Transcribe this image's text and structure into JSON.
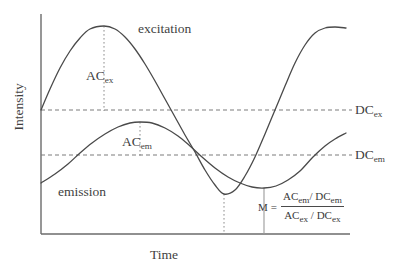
{
  "figure": {
    "axes": {
      "x_label": "Time",
      "y_label": "Intensity"
    },
    "curve_labels": {
      "excitation": "excitation",
      "emission": "emission"
    },
    "amplitude_labels": {
      "ac_ex_prefix": "AC",
      "ac_ex_sub": "ex",
      "ac_em_prefix": "AC",
      "ac_em_sub": "em"
    },
    "level_labels": {
      "dc_ex_prefix": "DC",
      "dc_ex_sub": "ex",
      "dc_em_prefix": "DC",
      "dc_em_sub": "em"
    },
    "formula": {
      "lhs": "M",
      "equals": "=",
      "numerator": "AC em / DC em",
      "denominator": "AC ex / DC ex",
      "num_first": "AC",
      "num_first_sub": "em",
      "num_slash": "/",
      "num_second": "DC",
      "num_second_sub": "em",
      "den_first": "AC",
      "den_first_sub": "ex",
      "den_slash": "/",
      "den_second": "DC",
      "den_second_sub": "ex"
    },
    "colors": {
      "curve": "#4a4a4a",
      "axis": "#6b6b6b",
      "dc_line": "#7d7d7d",
      "marker": "#8c8c8c",
      "text": "#3f3f3f",
      "background": "#ffffff"
    }
  },
  "chart_data": {
    "type": "line",
    "title": "",
    "xlabel": "Time",
    "ylabel": "Intensity",
    "xlim": [
      0,
      1
    ],
    "ylim": [
      0,
      1
    ],
    "grid": false,
    "legend": "inline-annotations",
    "plot_geometry": {
      "x_axis_y": 234,
      "y_axis_x": 41,
      "plot_right": 350,
      "plot_top": 14
    },
    "series": [
      {
        "name": "excitation",
        "dc_level_y": 110,
        "amplitude_y": 84,
        "period_px": 240,
        "start_x": 41,
        "end_x": 346,
        "phase_deg": 0,
        "peak_x": 104,
        "peak_y": 26,
        "trough_x": 224,
        "trough_y": 194,
        "samples": [
          [
            41,
            110
          ],
          [
            50,
            89
          ],
          [
            60,
            68
          ],
          [
            70,
            51
          ],
          [
            80,
            38
          ],
          [
            90,
            29
          ],
          [
            104,
            26
          ],
          [
            115,
            29
          ],
          [
            125,
            37
          ],
          [
            135,
            49
          ],
          [
            145,
            64
          ],
          [
            155,
            81
          ],
          [
            165,
            99
          ],
          [
            175,
            117
          ],
          [
            185,
            135
          ],
          [
            195,
            152
          ],
          [
            205,
            170
          ],
          [
            215,
            185
          ],
          [
            224,
            194
          ],
          [
            235,
            190
          ],
          [
            245,
            176
          ],
          [
            255,
            157
          ],
          [
            265,
            134
          ],
          [
            275,
            110
          ],
          [
            285,
            86
          ],
          [
            295,
            63
          ],
          [
            305,
            45
          ],
          [
            315,
            33
          ],
          [
            325,
            28
          ],
          [
            335,
            27
          ],
          [
            346,
            28
          ]
        ]
      },
      {
        "name": "emission",
        "dc_level_y": 155,
        "amplitude_y": 33,
        "period_px": 248,
        "start_x": 41,
        "end_x": 346,
        "phase_shift_px": 38,
        "peak_x": 140,
        "peak_y": 122,
        "trough_x": 264,
        "trough_y": 188,
        "samples": [
          [
            41,
            183
          ],
          [
            55,
            174
          ],
          [
            68,
            164
          ],
          [
            80,
            153
          ],
          [
            92,
            143
          ],
          [
            105,
            134
          ],
          [
            118,
            127
          ],
          [
            130,
            123
          ],
          [
            140,
            122
          ],
          [
            152,
            123
          ],
          [
            165,
            128
          ],
          [
            178,
            136
          ],
          [
            190,
            146
          ],
          [
            202,
            157
          ],
          [
            215,
            168
          ],
          [
            228,
            177
          ],
          [
            240,
            183
          ],
          [
            252,
            187
          ],
          [
            264,
            188
          ],
          [
            276,
            186
          ],
          [
            288,
            180
          ],
          [
            300,
            171
          ],
          [
            313,
            157
          ],
          [
            325,
            146
          ],
          [
            335,
            139
          ],
          [
            346,
            133
          ]
        ]
      }
    ],
    "reference_lines": [
      {
        "name": "DC_ex",
        "label": "DC",
        "sublabel": "ex",
        "y": 110,
        "x_start": 41,
        "x_end": 350,
        "style": "dashed",
        "orientation": "horizontal"
      },
      {
        "name": "DC_em",
        "label": "DC",
        "sublabel": "em",
        "y": 155,
        "x_start": 41,
        "x_end": 350,
        "style": "dashed",
        "orientation": "horizontal"
      }
    ],
    "annotation_lines": [
      {
        "name": "AC_ex_marker",
        "label": "AC",
        "sublabel": "ex",
        "x": 104,
        "y_start": 26,
        "y_end": 110,
        "style": "dotted",
        "orientation": "vertical",
        "meaning": "excitation AC amplitude from peak to DC level"
      },
      {
        "name": "AC_em_marker",
        "label": "AC",
        "sublabel": "em",
        "x": 140,
        "y_start": 122,
        "y_end": 156,
        "style": "dotted",
        "orientation": "vertical",
        "meaning": "emission AC amplitude from peak to DC level"
      },
      {
        "name": "excitation_trough_marker",
        "x": 224,
        "y_start": 194,
        "y_end": 234,
        "style": "dotted",
        "orientation": "vertical",
        "meaning": "time of excitation minimum"
      },
      {
        "name": "emission_trough_marker",
        "x": 264,
        "y_start": 188,
        "y_end": 234,
        "style": "solid",
        "orientation": "vertical",
        "meaning": "time of emission minimum, showing phase delay"
      }
    ],
    "annotations": [
      {
        "name": "excitation-label",
        "text": "excitation",
        "x": 138,
        "y": 28
      },
      {
        "name": "emission-label",
        "text": "emission",
        "x": 58,
        "y": 191
      },
      {
        "name": "modulation-formula",
        "text": "M = (AC_em / DC_em) / (AC_ex / DC_ex)",
        "x": 258,
        "y": 205
      }
    ]
  }
}
